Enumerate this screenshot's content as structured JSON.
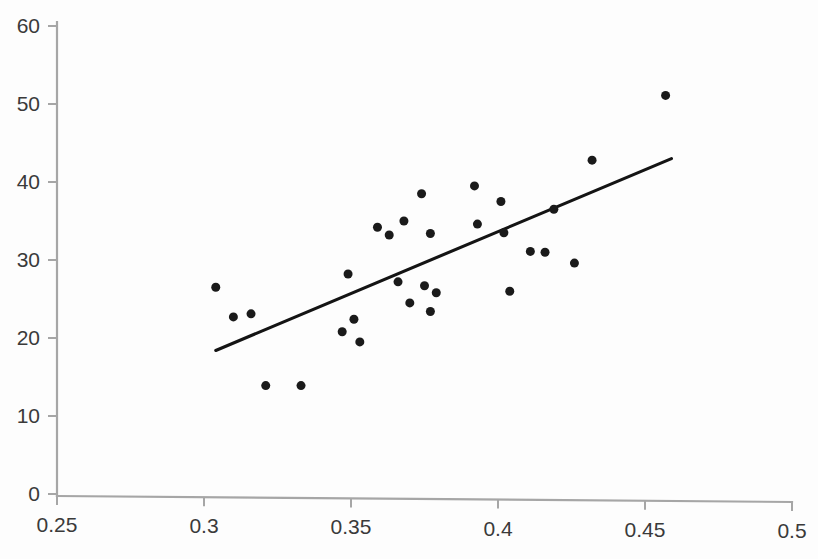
{
  "chart_data": {
    "type": "scatter",
    "title": "",
    "subtitle": "",
    "xlabel": "",
    "ylabel": "",
    "xlim": [
      0.25,
      0.5
    ],
    "ylim": [
      0,
      60
    ],
    "grid": false,
    "legend": null,
    "x_ticks": [
      0.25,
      0.3,
      0.35,
      0.4,
      0.45,
      0.5
    ],
    "x_tick_labels": [
      "0.25",
      "0.3",
      "0.35",
      "0.4",
      "0.45",
      "0.5"
    ],
    "y_ticks": [
      0,
      10,
      20,
      30,
      40,
      50,
      60
    ],
    "y_tick_labels": [
      "0",
      "10",
      "20",
      "30",
      "40",
      "50",
      "60"
    ],
    "marker": {
      "shape": "circle",
      "color": "#1a1a1a",
      "size_px": 9
    },
    "points": [
      {
        "x": 0.304,
        "y": 26.5
      },
      {
        "x": 0.31,
        "y": 22.7
      },
      {
        "x": 0.321,
        "y": 13.9
      },
      {
        "x": 0.316,
        "y": 23.1
      },
      {
        "x": 0.333,
        "y": 13.9
      },
      {
        "x": 0.347,
        "y": 20.8
      },
      {
        "x": 0.349,
        "y": 28.2
      },
      {
        "x": 0.351,
        "y": 22.4
      },
      {
        "x": 0.353,
        "y": 19.5
      },
      {
        "x": 0.359,
        "y": 34.2
      },
      {
        "x": 0.363,
        "y": 33.2
      },
      {
        "x": 0.366,
        "y": 27.2
      },
      {
        "x": 0.368,
        "y": 35.0
      },
      {
        "x": 0.37,
        "y": 24.5
      },
      {
        "x": 0.374,
        "y": 38.5
      },
      {
        "x": 0.375,
        "y": 26.7
      },
      {
        "x": 0.377,
        "y": 33.4
      },
      {
        "x": 0.377,
        "y": 23.4
      },
      {
        "x": 0.379,
        "y": 25.8
      },
      {
        "x": 0.392,
        "y": 39.5
      },
      {
        "x": 0.393,
        "y": 34.6
      },
      {
        "x": 0.401,
        "y": 37.5
      },
      {
        "x": 0.402,
        "y": 33.5
      },
      {
        "x": 0.404,
        "y": 26.0
      },
      {
        "x": 0.411,
        "y": 31.1
      },
      {
        "x": 0.416,
        "y": 31.0
      },
      {
        "x": 0.419,
        "y": 36.5
      },
      {
        "x": 0.426,
        "y": 29.6
      },
      {
        "x": 0.432,
        "y": 42.8
      },
      {
        "x": 0.457,
        "y": 51.1
      }
    ],
    "trend_line": {
      "type": "linear-fit",
      "x_start": 0.304,
      "y_start": 18.4,
      "x_end": 0.459,
      "y_end": 43.0,
      "color": "#141414"
    },
    "axis": {
      "color": "#a6a6a6",
      "x_axis_position_px": 496,
      "y_axis_position_px": 57
    }
  }
}
